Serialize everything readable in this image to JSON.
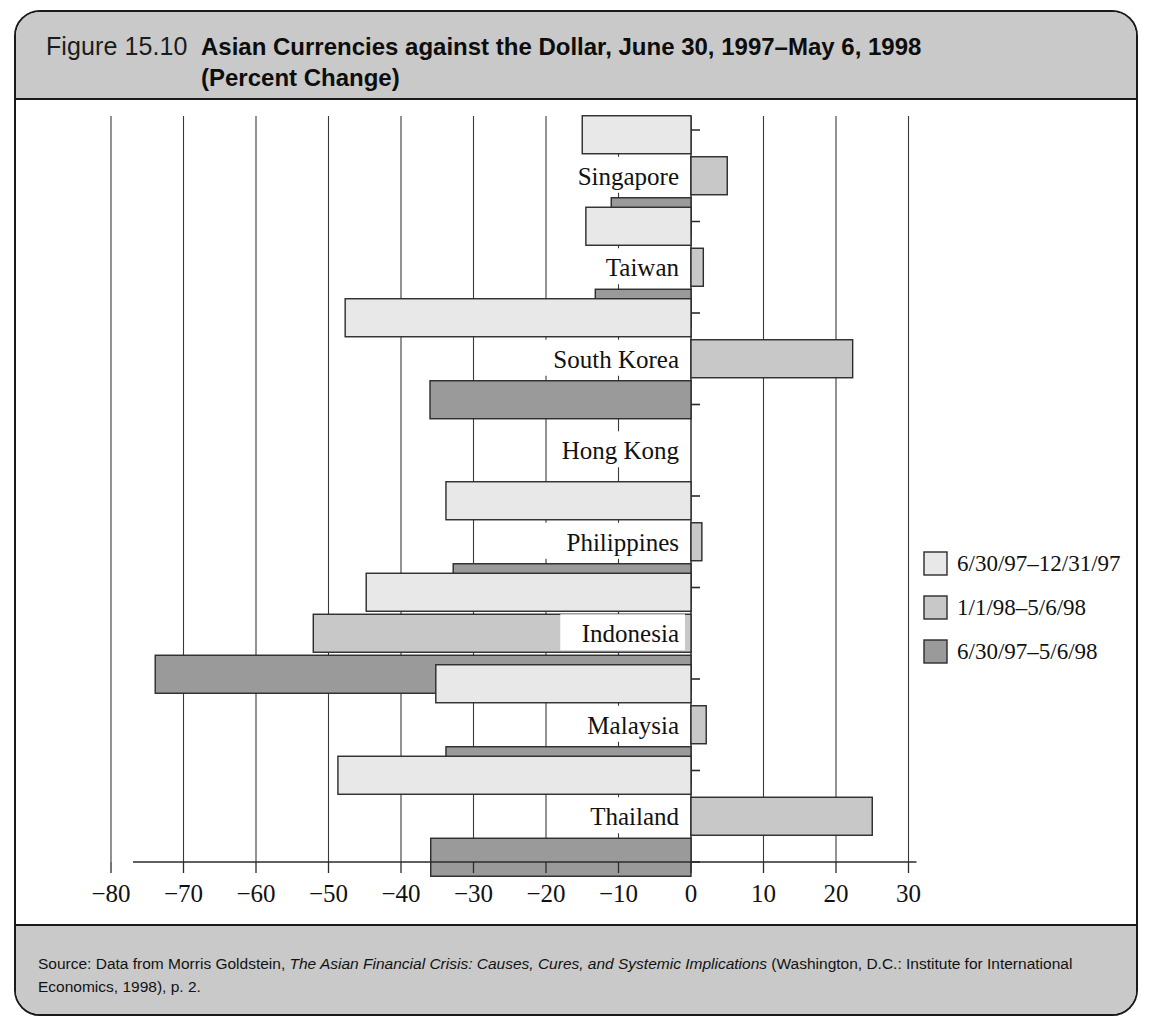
{
  "figure": {
    "number": "Figure 15.10",
    "title_line1": "Asian Currencies against the Dollar, June 30, 1997–May 6, 1998",
    "title_line2": "(Percent Change)"
  },
  "source": {
    "prefix": "Source: Data from Morris Goldstein, ",
    "italic_title": "The Asian Financial Crisis: Causes, Cures, and Systemic Implications",
    "suffix": " (Washington, D.C.: Institute for International Economics, 1998), p. 2."
  },
  "legend": {
    "items": [
      {
        "label": "6/30/97–12/31/97",
        "color": "#e8e8e8"
      },
      {
        "label": "1/1/98–5/6/98",
        "color": "#c8c8c8"
      },
      {
        "label": "6/30/97–5/6/98",
        "color": "#9a9a9a"
      }
    ]
  },
  "chart_data": {
    "type": "bar",
    "orientation": "horizontal",
    "title": "Asian Currencies against the Dollar, June 30, 1997–May 6, 1998 (Percent Change)",
    "xlabel": "",
    "ylabel": "",
    "xlim": [
      -85,
      32
    ],
    "xticks": [
      -80,
      -70,
      -60,
      -50,
      -40,
      -30,
      -20,
      -10,
      0,
      10,
      20,
      30
    ],
    "xticklabels": [
      "−80",
      "−70",
      "−60",
      "−50",
      "−40",
      "−30",
      "−20",
      "−10",
      "0",
      "10",
      "20",
      "30"
    ],
    "grid": true,
    "legend_position": "right",
    "categories": [
      "Singapore",
      "Taiwan",
      "South Korea",
      "Hong Kong",
      "Philippines",
      "Indonesia",
      "Malaysia",
      "Thailand"
    ],
    "series": [
      {
        "name": "6/30/97–12/31/97",
        "color": "#e8e8e8",
        "values": [
          -15.0,
          -14.5,
          -47.7,
          0.0,
          -33.8,
          -44.8,
          -35.2,
          -48.7
        ]
      },
      {
        "name": "1/1/98–5/6/98",
        "color": "#c8c8c8",
        "values": [
          5.0,
          1.7,
          22.3,
          0.0,
          1.5,
          -52.1,
          2.1,
          25.0
        ]
      },
      {
        "name": "6/30/97–5/6/98",
        "color": "#9a9a9a",
        "values": [
          -11.0,
          -13.2,
          -36.0,
          0.0,
          -32.8,
          -73.9,
          -33.8,
          -35.9
        ]
      }
    ]
  }
}
